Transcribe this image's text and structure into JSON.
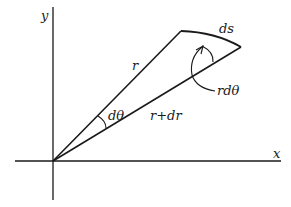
{
  "diagram": {
    "axes": {
      "x_label": "x",
      "y_label": "y"
    },
    "labels": {
      "r": "r",
      "r_plus_dr": "r+dr",
      "d_theta": "dθ",
      "ds": "ds",
      "r_d_theta": "rdθ"
    },
    "colors": {
      "stroke": "#1a1a1a",
      "background": "#ffffff"
    }
  }
}
